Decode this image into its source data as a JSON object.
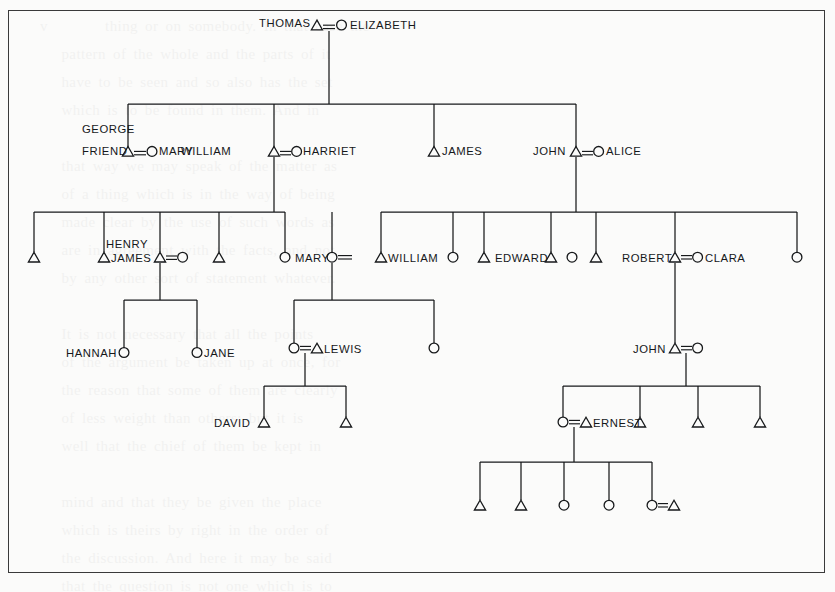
{
  "figure": {
    "kind": "kinship-genealogy-chart",
    "symbols": {
      "male": "triangle",
      "female": "circle",
      "marriage": "equals-sign"
    },
    "border_color": "#3a3a3a",
    "ink_color": "#17191b",
    "paper_color": "#fbfbfa"
  },
  "ghost_text": "v        thing or on somebody. In that case the\n   pattern of the whole and the parts of it\n   have to be seen and so also has the set\n   which is to be found in them. And in\n\n   that way we may speak of the matter as\n   of a thing which is in the way of being\n   made clear by the use of such words as\n   are in agreement with the facts, and not\n   by any other sort of statement whatever.\n\n   It is not necessary that all the points\n   of the argument be taken up at once, for\n   the reason that some of them are clearly\n   of less weight than others; but it is\n   well that the chief of them be kept in\n\n   mind and that they be given the place\n   which is theirs by right in the order of\n   the discussion. And here it may be said\n   that the question is not one which is to\n   be answered in a word, but one which\n\n   has in it a number of separate points,\n   each of which has to be looked at by\n   itself before the whole may be seen in\n   anything like a true light, and the\n   answer given in a form which is at once\n   simple and complete in every detail.",
  "generations": [
    {
      "id": "gen-1",
      "label": "generation-1",
      "nodes": [
        {
          "id": "thomas",
          "name": "THOMAS",
          "symbol": "triangle",
          "label_side": "left"
        },
        {
          "id": "elizabeth",
          "name": "ELIZABETH",
          "symbol": "circle",
          "label_side": "right"
        }
      ],
      "union": "THOMAS = ELIZABETH"
    },
    {
      "id": "gen-2",
      "label": "generation-2",
      "nodes": [
        {
          "id": "george-friend",
          "name": "GEORGE FRIEND",
          "symbol": "triangle",
          "label_side": "left",
          "name_lines": [
            "GEORGE",
            "FRIEND"
          ]
        },
        {
          "id": "mary-g2",
          "name": "MARY",
          "symbol": "circle",
          "label_side": "right"
        },
        {
          "id": "william-g2",
          "name": "WILLIAM",
          "symbol": "triangle",
          "label_side": "left"
        },
        {
          "id": "harriet",
          "name": "HARRIET",
          "symbol": "circle",
          "label_side": "right"
        },
        {
          "id": "james-g2",
          "name": "JAMES",
          "symbol": "triangle",
          "label_side": "right"
        },
        {
          "id": "john-g2",
          "name": "JOHN",
          "symbol": "triangle",
          "label_side": "left"
        },
        {
          "id": "alice",
          "name": "ALICE",
          "symbol": "circle",
          "label_side": "right"
        }
      ],
      "unions": [
        "GEORGE FRIEND = MARY",
        "WILLIAM = HARRIET",
        "JOHN = ALICE"
      ]
    },
    {
      "id": "gen-3",
      "label": "generation-3",
      "nodes": [
        {
          "id": "g3-1",
          "name": "",
          "symbol": "triangle",
          "label_side": "none"
        },
        {
          "id": "g3-henry-james",
          "name": "HENRY JAMES",
          "symbol": "triangle",
          "label_side": "right",
          "name_lines": [
            "HENRY",
            "JAMES"
          ]
        },
        {
          "id": "g3-3",
          "name": "",
          "symbol": "triangle",
          "label_side": "none"
        },
        {
          "id": "g3-3-spouse",
          "name": "",
          "symbol": "circle",
          "label_side": "none"
        },
        {
          "id": "g3-4",
          "name": "",
          "symbol": "triangle",
          "label_side": "none"
        },
        {
          "id": "g3-5",
          "name": "",
          "symbol": "circle",
          "label_side": "none"
        },
        {
          "id": "g3-mary",
          "name": "MARY",
          "symbol": "circle",
          "label_side": "left"
        },
        {
          "id": "g3-william",
          "name": "WILLIAM",
          "symbol": "triangle",
          "label_side": "right"
        },
        {
          "id": "g3-8",
          "name": "",
          "symbol": "circle",
          "label_side": "none"
        },
        {
          "id": "g3-9",
          "name": "",
          "symbol": "triangle",
          "label_side": "none"
        },
        {
          "id": "g3-edward",
          "name": "EDWARD",
          "symbol": "triangle",
          "label_side": "left"
        },
        {
          "id": "g3-11",
          "name": "",
          "symbol": "circle",
          "label_side": "none"
        },
        {
          "id": "g3-12",
          "name": "",
          "symbol": "triangle",
          "label_side": "none"
        },
        {
          "id": "g3-robert",
          "name": "ROBERT",
          "symbol": "triangle",
          "label_side": "left"
        },
        {
          "id": "g3-clara",
          "name": "CLARA",
          "symbol": "circle",
          "label_side": "right"
        },
        {
          "id": "g3-15",
          "name": "",
          "symbol": "circle",
          "label_side": "none"
        }
      ],
      "unions": [
        "MARY = WILLIAM",
        "ROBERT = CLARA"
      ]
    },
    {
      "id": "gen-4",
      "label": "generation-4",
      "nodes": [
        {
          "id": "hannah",
          "name": "HANNAH",
          "symbol": "circle",
          "label_side": "left"
        },
        {
          "id": "jane",
          "name": "JANE",
          "symbol": "circle",
          "label_side": "right"
        },
        {
          "id": "g4-lewis-wife",
          "name": "",
          "symbol": "circle",
          "label_side": "none"
        },
        {
          "id": "lewis",
          "name": "LEWIS",
          "symbol": "triangle",
          "label_side": "right"
        },
        {
          "id": "g4-4",
          "name": "",
          "symbol": "circle",
          "label_side": "none"
        },
        {
          "id": "john-g4",
          "name": "JOHN",
          "symbol": "triangle",
          "label_side": "left"
        },
        {
          "id": "john-g4-wife",
          "name": "",
          "symbol": "circle",
          "label_side": "none"
        }
      ],
      "unions": [
        "LEWIS = (wife)",
        "JOHN = (wife)"
      ]
    },
    {
      "id": "gen-5",
      "label": "generation-5",
      "nodes": [
        {
          "id": "david",
          "name": "DAVID",
          "symbol": "triangle",
          "label_side": "left"
        },
        {
          "id": "g5-2",
          "name": "",
          "symbol": "triangle",
          "label_side": "none"
        },
        {
          "id": "ernest-wife",
          "name": "",
          "symbol": "circle",
          "label_side": "none"
        },
        {
          "id": "ernest",
          "name": "ERNEST",
          "symbol": "triangle",
          "label_side": "right"
        },
        {
          "id": "g5-4",
          "name": "",
          "symbol": "triangle",
          "label_side": "none"
        },
        {
          "id": "g5-5",
          "name": "",
          "symbol": "triangle",
          "label_side": "none"
        },
        {
          "id": "g5-6",
          "name": "",
          "symbol": "triangle",
          "label_side": "none"
        }
      ],
      "unions": [
        "ERNEST = (wife)"
      ]
    },
    {
      "id": "gen-6",
      "label": "generation-6",
      "nodes": [
        {
          "id": "g6-1",
          "name": "",
          "symbol": "triangle",
          "label_side": "none"
        },
        {
          "id": "g6-2",
          "name": "",
          "symbol": "triangle",
          "label_side": "none"
        },
        {
          "id": "g6-3",
          "name": "",
          "symbol": "circle",
          "label_side": "none"
        },
        {
          "id": "g6-4",
          "name": "",
          "symbol": "circle",
          "label_side": "none"
        },
        {
          "id": "g6-5",
          "name": "",
          "symbol": "circle",
          "label_side": "none"
        },
        {
          "id": "g6-5-spouse",
          "name": "",
          "symbol": "triangle",
          "label_side": "none"
        }
      ],
      "unions": [
        "(daughter) = (husband)"
      ]
    }
  ],
  "labels": {
    "thomas": "THOMAS",
    "elizabeth": "ELIZABETH",
    "george": "GEORGE",
    "friend": "FRIEND",
    "mary_g2": "MARY",
    "william_g2": "WILLIAM",
    "harriet": "HARRIET",
    "james_g2": "JAMES",
    "john_g2": "JOHN",
    "alice": "ALICE",
    "henry": "HENRY",
    "james_g3": "JAMES",
    "mary_g3": "MARY",
    "william_g3": "WILLIAM",
    "edward": "EDWARD",
    "robert": "ROBERT",
    "clara": "CLARA",
    "hannah": "HANNAH",
    "jane": "JANE",
    "lewis": "LEWIS",
    "john_g4": "JOHN",
    "david": "DAVID",
    "ernest": "ERNEST"
  }
}
